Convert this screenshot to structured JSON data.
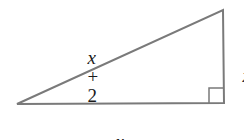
{
  "diagram": {
    "type": "right-triangle",
    "stroke_color": "#7a7a7a",
    "vertices": {
      "bottom_left": [
        17,
        104
      ],
      "bottom_right": [
        224,
        103
      ],
      "top_right": [
        223,
        10
      ]
    },
    "right_angle_marker": {
      "position": "bottom-right",
      "size": 15
    },
    "labels": {
      "hypotenuse": {
        "variable": "x",
        "operator": "+",
        "constant": "2"
      },
      "vertical_leg": {
        "variable": "x"
      },
      "horizontal_leg": {
        "variable": "x",
        "operator": "+",
        "constant": "1"
      }
    }
  }
}
